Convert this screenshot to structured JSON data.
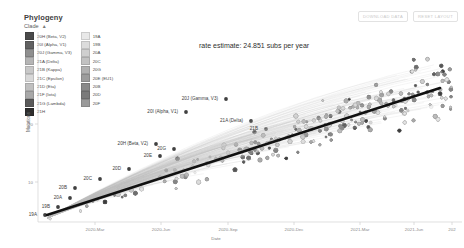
{
  "panel": {
    "title": "Phylogeny",
    "control_label": "Clade",
    "control_caret": "▲"
  },
  "buttons": [
    {
      "name": "download-data-button",
      "label": "DOWNLOAD DATA"
    },
    {
      "name": "reset-layout-button",
      "label": "RESET LAYOUT"
    }
  ],
  "legend": {
    "column1": [
      {
        "label": "20H (Beta, V2)",
        "color": "#4a4a4a"
      },
      {
        "label": "20I (Alpha, V1)",
        "color": "#616161"
      },
      {
        "label": "20J (Gamma, V3)",
        "color": "#8f8f8f"
      },
      {
        "label": "21A (Delta)",
        "color": "#b5b5b5"
      },
      {
        "label": "21B (Kappa)",
        "color": "#c8c8c8"
      },
      {
        "label": "21C (Epsilon)",
        "color": "#d8d8d8"
      },
      {
        "label": "21D (Eta)",
        "color": "#c0c0c0"
      },
      {
        "label": "21F (Iota)",
        "color": "#a8a8a8"
      },
      {
        "label": "21G (Lambda)",
        "color": "#5a5a5a"
      },
      {
        "label": "21H",
        "color": "#2e2e2e"
      }
    ],
    "column2": [
      {
        "label": "19A",
        "color": "#e8e8e8"
      },
      {
        "label": "19B",
        "color": "#dcdcdc"
      },
      {
        "label": "20A",
        "color": "#cfcfcf"
      },
      {
        "label": "20C",
        "color": "#c2c2c2"
      },
      {
        "label": "20G",
        "color": "#b0b0b0"
      },
      {
        "label": "20E (EU1)",
        "color": "#9c9c9c"
      },
      {
        "label": "20B",
        "color": "#8a8a8a"
      },
      {
        "label": "20D",
        "color": "#7a7a7a"
      },
      {
        "label": "20F",
        "color": "#9a9a9a"
      }
    ]
  },
  "annotation": {
    "rate_estimate": "rate estimate: 24.851 subs per year"
  },
  "chart_data": {
    "type": "scatter",
    "title": "Phylogeny",
    "xlabel": "Date",
    "ylabel": "Mutations",
    "xticks": [
      "2020-Mar",
      "2020-Jun",
      "2020-Sep",
      "2020-Dec",
      "2021-Mar",
      "2021-Jun",
      "202"
    ],
    "xtick_positions": [
      95,
      161,
      228,
      294,
      360,
      414,
      452
    ],
    "yticks": [
      "20",
      "10"
    ],
    "ytick_positions": [
      124,
      182
    ],
    "grid": false,
    "regression": {
      "label": "rate estimate: 24.851 subs per year",
      "slope_subs_per_year": 24.851,
      "x_start": 47,
      "y_start": 215,
      "x_end": 440,
      "y_end": 88
    },
    "point_labels": [
      {
        "text": "19A",
        "x": 37,
        "y": 216
      },
      {
        "text": "19B",
        "x": 50,
        "y": 208
      },
      {
        "text": "20A",
        "x": 62,
        "y": 199
      },
      {
        "text": "20B",
        "x": 67,
        "y": 189
      },
      {
        "text": "20C",
        "x": 92,
        "y": 180
      },
      {
        "text": "20D",
        "x": 121,
        "y": 170
      },
      {
        "text": "20E",
        "x": 152,
        "y": 157
      },
      {
        "text": "20G",
        "x": 166,
        "y": 150
      },
      {
        "text": "20H (Beta, V2)",
        "x": 148,
        "y": 145
      },
      {
        "text": "20I (Alpha, V1)",
        "x": 178,
        "y": 113
      },
      {
        "text": "20J (Gamma, V3)",
        "x": 218,
        "y": 100
      },
      {
        "text": "21A (Delta)",
        "x": 243,
        "y": 122
      },
      {
        "text": "21B",
        "x": 258,
        "y": 130
      }
    ]
  }
}
